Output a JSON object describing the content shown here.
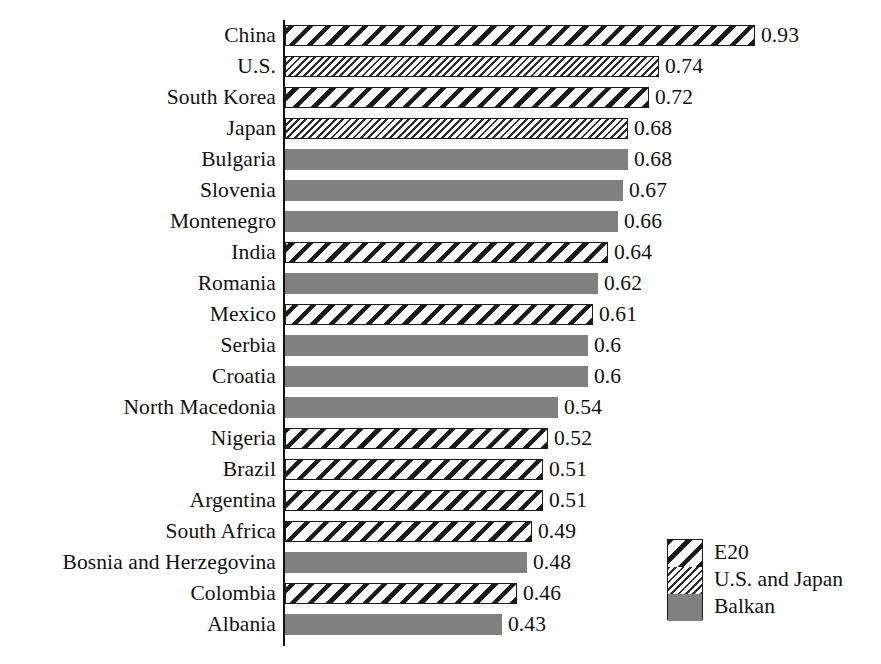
{
  "chart_data": {
    "type": "bar",
    "orientation": "horizontal",
    "title": "",
    "subtitle": "",
    "xlabel": "",
    "ylabel": "",
    "grid": false,
    "xlim": [
      0,
      0.93
    ],
    "axis_origin_value": 0,
    "legend_position": "bottom-right",
    "categories": [
      "China",
      "U.S.",
      "South Korea",
      "Japan",
      "Bulgaria",
      "Slovenia",
      "Montenegro",
      "India",
      "Romania",
      "Mexico",
      "Serbia",
      "Croatia",
      "North Macedonia",
      "Nigeria",
      "Brazil",
      "Argentina",
      "South Africa",
      "Bosnia and Herzegovina",
      "Colombia",
      "Albania"
    ],
    "values": [
      0.93,
      0.74,
      0.72,
      0.68,
      0.68,
      0.67,
      0.66,
      0.64,
      0.62,
      0.61,
      0.6,
      0.6,
      0.54,
      0.52,
      0.51,
      0.51,
      0.49,
      0.48,
      0.46,
      0.43
    ],
    "value_labels": [
      "0.93",
      "0.74",
      "0.72",
      "0.68",
      "0.68",
      "0.67",
      "0.66",
      "0.64",
      "0.62",
      "0.61",
      "0.6",
      "0.6",
      "0.54",
      "0.52",
      "0.51",
      "0.51",
      "0.49",
      "0.48",
      "0.46",
      "0.43"
    ],
    "groups": [
      "E20",
      "U.S. and Japan",
      "E20",
      "U.S. and Japan",
      "Balkan",
      "Balkan",
      "Balkan",
      "E20",
      "Balkan",
      "E20",
      "Balkan",
      "Balkan",
      "Balkan",
      "E20",
      "E20",
      "E20",
      "E20",
      "Balkan",
      "E20",
      "Balkan"
    ],
    "legend": [
      {
        "label": "E20",
        "pattern": "coarse-diagonal-hatch",
        "color": "#1a1a1a"
      },
      {
        "label": "U.S. and Japan",
        "pattern": "fine-diagonal-hatch",
        "color": "#2b2b2b"
      },
      {
        "label": "Balkan",
        "pattern": "solid-fill",
        "color": "#808080"
      }
    ]
  }
}
